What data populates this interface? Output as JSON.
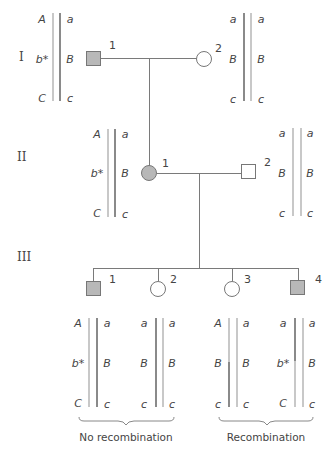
{
  "generations": {
    "I": {
      "label": "I"
    },
    "II": {
      "label": "II"
    },
    "III": {
      "label": "III"
    }
  },
  "individuals": {
    "I_1": {
      "number": "1",
      "sex": "male",
      "affected": true,
      "chrom_left": [
        "A",
        "b*",
        "C"
      ],
      "chrom_right": [
        "a",
        "B",
        "c"
      ]
    },
    "I_2": {
      "number": "2",
      "sex": "female",
      "affected": false,
      "chrom_left": [
        "a",
        "B",
        "c"
      ],
      "chrom_right": [
        "a",
        "B",
        "c"
      ]
    },
    "II_1": {
      "number": "1",
      "sex": "female",
      "affected": true,
      "chrom_left": [
        "A",
        "b*",
        "C"
      ],
      "chrom_right": [
        "a",
        "B",
        "c"
      ]
    },
    "II_2": {
      "number": "2",
      "sex": "male",
      "affected": false,
      "chrom_left": [
        "a",
        "B",
        "c"
      ],
      "chrom_right": [
        "a",
        "B",
        "c"
      ]
    },
    "III_1": {
      "number": "1",
      "sex": "male",
      "affected": true,
      "chrom_left": [
        "A",
        "b*",
        "C"
      ],
      "chrom_right": [
        "a",
        "B",
        "c"
      ]
    },
    "III_2": {
      "number": "2",
      "sex": "female",
      "affected": false,
      "chrom_left": [
        "a",
        "B",
        "c"
      ],
      "chrom_right": [
        "a",
        "B",
        "c"
      ]
    },
    "III_3": {
      "number": "3",
      "sex": "female",
      "affected": false,
      "chrom_left": [
        "A",
        "B",
        "c"
      ],
      "chrom_right": [
        "a",
        "B",
        "c"
      ]
    },
    "III_4": {
      "number": "4",
      "sex": "male",
      "affected": true,
      "chrom_left": [
        "a",
        "b*",
        "C"
      ],
      "chrom_right": [
        "a",
        "B",
        "c"
      ]
    }
  },
  "captions": {
    "no_recombination": "No recombination",
    "recombination": "Recombination"
  },
  "colors": {
    "affected_fill": "#b8b8b8",
    "chromosome_light": "#c8c8c8",
    "chromosome_dark": "#8a8a8a",
    "line": "#7a7a7a"
  }
}
